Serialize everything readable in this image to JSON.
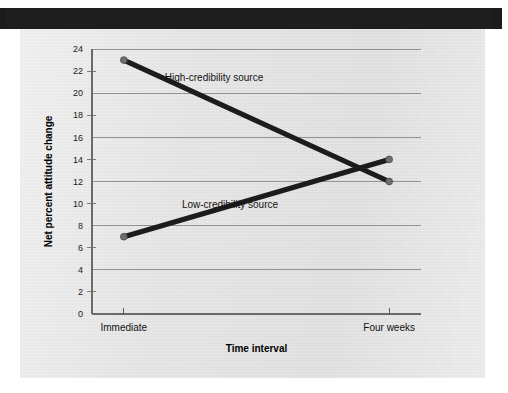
{
  "figure": {
    "background_color": "#ffffff",
    "panel_color": "#e3e3e3",
    "banner_color": "#1b1b1b"
  },
  "chart_data": {
    "type": "line",
    "title": "",
    "subtitle": "",
    "xlabel": "Time interval",
    "ylabel": "Net percent attitude change",
    "categories": [
      "Immediate",
      "Four weeks"
    ],
    "x": [
      0,
      1
    ],
    "ylim": [
      0,
      24
    ],
    "xlim": [
      -0.12,
      1.12
    ],
    "y_tick_step": 2,
    "y_tick_labels": [
      "0",
      "2",
      "4",
      "6",
      "8",
      "10",
      "12",
      "14",
      "16",
      "18",
      "20",
      "22",
      "24"
    ],
    "y_ticks": [
      0,
      2,
      4,
      6,
      8,
      10,
      12,
      14,
      16,
      18,
      20,
      22,
      24
    ],
    "y_gridline_values": [
      0,
      4,
      8,
      12,
      16,
      20,
      24
    ],
    "y_minor_tick_values": [
      2,
      6,
      10,
      14,
      18,
      22
    ],
    "grid": "horizontal-major-only",
    "legend_position": "inline-annotations",
    "line_color": "#1c1c1c",
    "marker_color": "#6e6e6e",
    "series": [
      {
        "name": "High-credibility source",
        "values": [
          23,
          12
        ],
        "label_text": "High-credibility source",
        "label_x": 0.34,
        "label_y": 21.1
      },
      {
        "name": "Low-credibility source",
        "values": [
          7,
          14
        ],
        "label_text": "Low-credibility source",
        "label_x": 0.4,
        "label_y": 9.6
      }
    ],
    "annotations": [
      {
        "text": "High-credibility source"
      },
      {
        "text": "Low-credibility source"
      }
    ]
  }
}
